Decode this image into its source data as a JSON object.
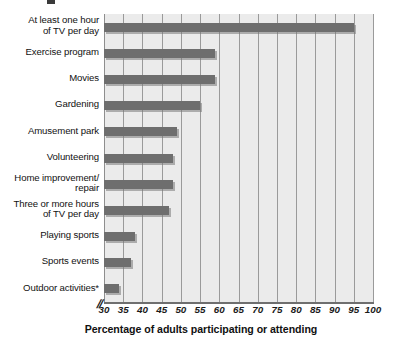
{
  "chart_data": {
    "type": "bar",
    "orientation": "horizontal",
    "title": "",
    "xlabel": "Percentage of adults participating or attending",
    "ylabel": "",
    "xlim": [
      30,
      100
    ],
    "xtick_step": 5,
    "axis_break": true,
    "grid": true,
    "legend": "none",
    "bar_color": "#6e6e6e",
    "plot_background": "#ebebeb",
    "categories": [
      "At least one hour\nof TV per day",
      "Exercise program",
      "Movies",
      "Gardening",
      "Amusement park",
      "Volunteering",
      "Home improvement/\nrepair",
      "Three or more hours\nof TV per day",
      "Playing sports",
      "Sports events",
      "Outdoor activities*"
    ],
    "values": [
      95,
      59,
      59,
      55,
      49,
      48,
      48,
      47,
      38,
      37,
      34
    ],
    "ticks": [
      {
        "value": 30,
        "label": "30"
      },
      {
        "value": 35,
        "label": "35"
      },
      {
        "value": 40,
        "label": "40"
      },
      {
        "value": 45,
        "label": "45"
      },
      {
        "value": 50,
        "label": "50"
      },
      {
        "value": 55,
        "label": "55"
      },
      {
        "value": 60,
        "label": "60"
      },
      {
        "value": 65,
        "label": "65"
      },
      {
        "value": 70,
        "label": "70"
      },
      {
        "value": 75,
        "label": "75"
      },
      {
        "value": 80,
        "label": "80"
      },
      {
        "value": 85,
        "label": "85"
      },
      {
        "value": 90,
        "label": "90"
      },
      {
        "value": 95,
        "label": "95"
      },
      {
        "value": 100,
        "label": "100"
      }
    ],
    "axis_break_symbol": "//"
  }
}
